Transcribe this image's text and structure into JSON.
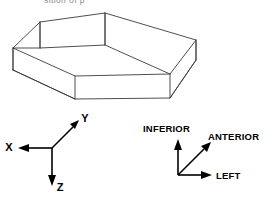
{
  "figure": {
    "caption_partial": "sition  of  p",
    "title": "",
    "shape": {
      "name": "hexagonal-prism",
      "description": "hexagonal prism wireframe viewed from above",
      "top_face_vertices": [
        [
          105,
          13
        ],
        [
          196,
          40
        ],
        [
          170,
          74
        ],
        [
          75,
          76
        ],
        [
          13,
          48
        ],
        [
          40,
          22
        ]
      ],
      "bottom_face_vertices": [
        [
          196,
          60
        ],
        [
          170,
          98
        ],
        [
          75,
          99
        ],
        [
          13,
          70
        ]
      ],
      "vertical_edge_pairs": [
        [
          [
            13,
            48
          ],
          [
            13,
            70
          ]
        ],
        [
          [
            40,
            22
          ],
          [
            40,
            48
          ]
        ],
        [
          [
            105,
            13
          ],
          [
            105,
            45
          ]
        ],
        [
          [
            196,
            40
          ],
          [
            196,
            60
          ]
        ],
        [
          [
            170,
            74
          ],
          [
            170,
            98
          ]
        ],
        [
          [
            75,
            76
          ],
          [
            75,
            99
          ]
        ]
      ]
    },
    "math_axes": {
      "name": "xyz-coordinate-frame",
      "origin": [
        52,
        148
      ],
      "axes": [
        {
          "label": "X",
          "direction": "left",
          "tip": [
            20,
            148
          ],
          "label_pos": [
            9,
            146
          ]
        },
        {
          "label": "Y",
          "direction": "up-right",
          "tip": [
            78,
            121
          ],
          "label_pos": [
            84,
            119
          ]
        },
        {
          "label": "Z",
          "direction": "down",
          "tip": [
            52,
            183
          ],
          "label_pos": [
            57,
            190
          ]
        }
      ]
    },
    "anatomical_axes": {
      "name": "anatomical-orientation-frame",
      "origin": [
        178,
        175
      ],
      "axes": [
        {
          "label": "INFERIOR",
          "direction": "up",
          "tip": [
            178,
            141
          ],
          "label_pos": [
            146,
            128
          ]
        },
        {
          "label": "ANTERIOR",
          "direction": "up-right",
          "tip": [
            208,
            144
          ],
          "label_pos": [
            211,
            136
          ]
        },
        {
          "label": "LEFT",
          "direction": "right",
          "tip": [
            212,
            175
          ],
          "label_pos": [
            218,
            179
          ]
        }
      ]
    },
    "colors": {
      "background": "#ffffff",
      "line": "#3a3a42",
      "axis": "#000000",
      "text": "#000000",
      "caption": "#8d8d8d"
    }
  }
}
